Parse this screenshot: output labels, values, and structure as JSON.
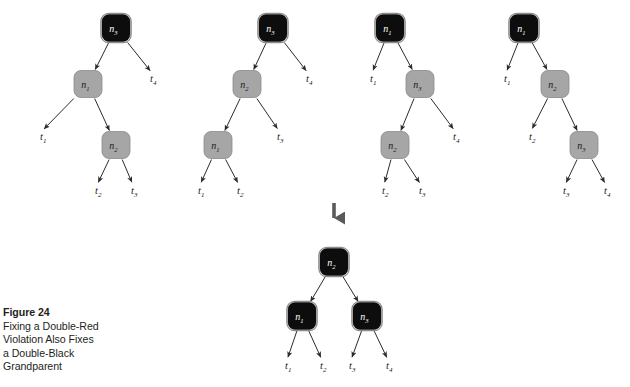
{
  "figure": {
    "label": "Figure 24",
    "description_lines": [
      "Fixing a Double-Red",
      "Violation Also Fixes",
      "a Double-Black",
      "Grandparent"
    ]
  },
  "colors": {
    "black_node_fill": "#0d0d0d",
    "black_node_border": "#8c8c8c",
    "gray_node_fill": "#a6a6a6",
    "gray_node_border": "#8a8a8a",
    "black_node_text": "#ffffff",
    "gray_node_text": "#1a1a1a",
    "edge": "#2b2b2b",
    "background": "#ffffff",
    "caption_text": "#231f20",
    "transform_arrow": "#5a5a5a"
  },
  "transform_arrow": {
    "name": "downward-transform-arrow",
    "x": 334,
    "y_top": 203,
    "y_bottom": 227
  },
  "node_size": {
    "w": 28,
    "h": 27,
    "r": 7
  },
  "trees": [
    {
      "id": "case-1",
      "name": "tree-case-1",
      "nodes": [
        {
          "id": "n3",
          "label": "n",
          "sub": "3",
          "color": "black",
          "cx": 116,
          "cy": 28
        },
        {
          "id": "n1",
          "label": "n",
          "sub": "1",
          "color": "gray",
          "cx": 88,
          "cy": 84
        },
        {
          "id": "n2",
          "label": "n",
          "sub": "2",
          "color": "gray",
          "cx": 116,
          "cy": 145
        }
      ],
      "leaves": [
        {
          "id": "t4",
          "label": "t",
          "sub": "4",
          "x": 150,
          "y": 82
        },
        {
          "id": "t1",
          "label": "t",
          "sub": "1",
          "x": 40,
          "y": 140
        },
        {
          "id": "t2",
          "label": "t",
          "sub": "2",
          "x": 95,
          "y": 194
        },
        {
          "id": "t3",
          "label": "t",
          "sub": "3",
          "x": 131,
          "y": 194
        }
      ],
      "edges": [
        {
          "from": "n3",
          "to": "n1",
          "kind": "node"
        },
        {
          "from": "n3",
          "to": "t4",
          "kind": "leaf"
        },
        {
          "from": "n1",
          "to": "t1",
          "kind": "leaf"
        },
        {
          "from": "n1",
          "to": "n2",
          "kind": "node"
        },
        {
          "from": "n2",
          "to": "t2",
          "kind": "leaf"
        },
        {
          "from": "n2",
          "to": "t3",
          "kind": "leaf"
        }
      ]
    },
    {
      "id": "case-2",
      "name": "tree-case-2",
      "nodes": [
        {
          "id": "n3",
          "label": "n",
          "sub": "3",
          "color": "black",
          "cx": 273,
          "cy": 28
        },
        {
          "id": "n2",
          "label": "n",
          "sub": "2",
          "color": "gray",
          "cx": 247,
          "cy": 84
        },
        {
          "id": "n1",
          "label": "n",
          "sub": "1",
          "color": "gray",
          "cx": 218,
          "cy": 145
        }
      ],
      "leaves": [
        {
          "id": "t4",
          "label": "t",
          "sub": "4",
          "x": 306,
          "y": 82
        },
        {
          "id": "t3",
          "label": "t",
          "sub": "3",
          "x": 277,
          "y": 140
        },
        {
          "id": "t1",
          "label": "t",
          "sub": "1",
          "x": 198,
          "y": 194
        },
        {
          "id": "t2",
          "label": "t",
          "sub": "2",
          "x": 237,
          "y": 194
        }
      ],
      "edges": [
        {
          "from": "n3",
          "to": "n2",
          "kind": "node"
        },
        {
          "from": "n3",
          "to": "t4",
          "kind": "leaf"
        },
        {
          "from": "n2",
          "to": "n1",
          "kind": "node"
        },
        {
          "from": "n2",
          "to": "t3",
          "kind": "leaf"
        },
        {
          "from": "n1",
          "to": "t1",
          "kind": "leaf"
        },
        {
          "from": "n1",
          "to": "t2",
          "kind": "leaf"
        }
      ]
    },
    {
      "id": "case-3",
      "name": "tree-case-3",
      "nodes": [
        {
          "id": "n1",
          "label": "n",
          "sub": "1",
          "color": "black",
          "cx": 390,
          "cy": 28
        },
        {
          "id": "n3",
          "label": "n",
          "sub": "3",
          "color": "gray",
          "cx": 420,
          "cy": 84
        },
        {
          "id": "n2",
          "label": "n",
          "sub": "2",
          "color": "gray",
          "cx": 395,
          "cy": 145
        }
      ],
      "leaves": [
        {
          "id": "t1",
          "label": "t",
          "sub": "1",
          "x": 370,
          "y": 82
        },
        {
          "id": "t4",
          "label": "t",
          "sub": "4",
          "x": 453,
          "y": 140
        },
        {
          "id": "t2",
          "label": "t",
          "sub": "2",
          "x": 382,
          "y": 194
        },
        {
          "id": "t3",
          "label": "t",
          "sub": "3",
          "x": 419,
          "y": 194
        }
      ],
      "edges": [
        {
          "from": "n1",
          "to": "t1",
          "kind": "leaf"
        },
        {
          "from": "n1",
          "to": "n3",
          "kind": "node"
        },
        {
          "from": "n3",
          "to": "n2",
          "kind": "node"
        },
        {
          "from": "n3",
          "to": "t4",
          "kind": "leaf"
        },
        {
          "from": "n2",
          "to": "t2",
          "kind": "leaf"
        },
        {
          "from": "n2",
          "to": "t3",
          "kind": "leaf"
        }
      ]
    },
    {
      "id": "case-4",
      "name": "tree-case-4",
      "nodes": [
        {
          "id": "n1",
          "label": "n",
          "sub": "1",
          "color": "black",
          "cx": 524,
          "cy": 28
        },
        {
          "id": "n2",
          "label": "n",
          "sub": "2",
          "color": "gray",
          "cx": 555,
          "cy": 84
        },
        {
          "id": "n3",
          "label": "n",
          "sub": "3",
          "color": "gray",
          "cx": 584,
          "cy": 145
        }
      ],
      "leaves": [
        {
          "id": "t1",
          "label": "t",
          "sub": "1",
          "x": 504,
          "y": 82
        },
        {
          "id": "t2",
          "label": "t",
          "sub": "2",
          "x": 529,
          "y": 140
        },
        {
          "id": "t3",
          "label": "t",
          "sub": "3",
          "x": 563,
          "y": 194
        },
        {
          "id": "t4",
          "label": "t",
          "sub": "4",
          "x": 604,
          "y": 194
        }
      ],
      "edges": [
        {
          "from": "n1",
          "to": "t1",
          "kind": "leaf"
        },
        {
          "from": "n1",
          "to": "n2",
          "kind": "node"
        },
        {
          "from": "n2",
          "to": "t2",
          "kind": "leaf"
        },
        {
          "from": "n2",
          "to": "n3",
          "kind": "node"
        },
        {
          "from": "n3",
          "to": "t3",
          "kind": "leaf"
        },
        {
          "from": "n3",
          "to": "t4",
          "kind": "leaf"
        }
      ]
    },
    {
      "id": "result",
      "name": "tree-result",
      "nodes": [
        {
          "id": "n2",
          "label": "n",
          "sub": "2",
          "color": "black",
          "cx": 334,
          "cy": 262
        },
        {
          "id": "n1",
          "label": "n",
          "sub": "1",
          "color": "black",
          "cx": 302,
          "cy": 316
        },
        {
          "id": "n3",
          "label": "n",
          "sub": "3",
          "color": "black",
          "cx": 367,
          "cy": 316
        }
      ],
      "leaves": [
        {
          "id": "t1",
          "label": "t",
          "sub": "1",
          "x": 285,
          "y": 369
        },
        {
          "id": "t2",
          "label": "t",
          "sub": "2",
          "x": 320,
          "y": 369
        },
        {
          "id": "t3",
          "label": "t",
          "sub": "3",
          "x": 349,
          "y": 369
        },
        {
          "id": "t4",
          "label": "t",
          "sub": "4",
          "x": 386,
          "y": 369
        }
      ],
      "edges": [
        {
          "from": "n2",
          "to": "n1",
          "kind": "node"
        },
        {
          "from": "n2",
          "to": "n3",
          "kind": "node"
        },
        {
          "from": "n1",
          "to": "t1",
          "kind": "leaf"
        },
        {
          "from": "n1",
          "to": "t2",
          "kind": "leaf"
        },
        {
          "from": "n3",
          "to": "t3",
          "kind": "leaf"
        },
        {
          "from": "n3",
          "to": "t4",
          "kind": "leaf"
        }
      ]
    }
  ]
}
